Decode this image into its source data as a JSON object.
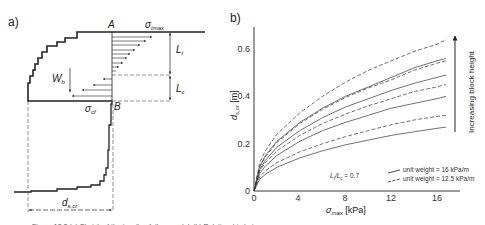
{
  "panel_a": {
    "label": "a)",
    "point_a": "A",
    "point_b": "B",
    "sigma_tmax": "σ",
    "sigma_tmax_sub": "tmax",
    "sigma_cf": "σ",
    "sigma_cf_sub": "cf",
    "weight": "W",
    "weight_sub": "b",
    "length_t": "L",
    "length_t_sub": "t",
    "length_c": "L",
    "length_c_sub": "c",
    "displacement": "d",
    "displacement_sub": "s,cr"
  },
  "panel_b": {
    "label": "b)",
    "arrow_label": "Increasing block height",
    "ratio_label": "L",
    "ratio_text": "t/L",
    "ratio_value": "c = 0.7",
    "legend": [
      {
        "style": "solid",
        "label": "unit weight = 16 kPa/m"
      },
      {
        "style": "dashed",
        "label": "unit weight = 12.5 kPa/m"
      }
    ]
  },
  "caption": "Figure 12.2 (a) Sketch of the toppling failure model; (b) Relationship between cr...",
  "chart_data": {
    "type": "line",
    "title": "",
    "xlabel": "σtmax [kPa]",
    "ylabel": "ds,cr [m]",
    "xlim": [
      0,
      18
    ],
    "ylim": [
      0,
      0.68
    ],
    "xticks": [
      0,
      4,
      8,
      12,
      16
    ],
    "yticks": [
      0,
      0.2,
      0.4,
      0.6
    ],
    "grid": false,
    "legend_position": "lower right",
    "annotations": [
      "Lt/Lc = 0.7",
      "Increasing block height (arrow upward)"
    ],
    "x": [
      0,
      0.5,
      1,
      2,
      4,
      6,
      8,
      10,
      12,
      14,
      16,
      16.8
    ],
    "series": [
      {
        "name": "unit weight = 12.5 kPa/m (h6)",
        "style": "dashed",
        "values": [
          0,
          0.12,
          0.17,
          0.24,
          0.33,
          0.4,
          0.46,
          0.51,
          0.55,
          0.59,
          0.62,
          0.64
        ]
      },
      {
        "name": "unit weight = 16 kPa/m (h5)",
        "style": "solid",
        "values": [
          0,
          0.105,
          0.15,
          0.21,
          0.29,
          0.35,
          0.4,
          0.44,
          0.48,
          0.52,
          0.55,
          0.56
        ]
      },
      {
        "name": "unit weight = 12.5 kPa/m (h5)",
        "style": "dashed",
        "values": [
          0,
          0.1,
          0.145,
          0.205,
          0.285,
          0.345,
          0.395,
          0.435,
          0.47,
          0.51,
          0.54,
          0.55
        ]
      },
      {
        "name": "unit weight = 16 kPa/m (h4)",
        "style": "solid",
        "values": [
          0,
          0.09,
          0.13,
          0.185,
          0.255,
          0.31,
          0.355,
          0.39,
          0.425,
          0.455,
          0.48,
          0.49
        ]
      },
      {
        "name": "unit weight = 12.5 kPa/m (h4)",
        "style": "dashed",
        "values": [
          0,
          0.085,
          0.12,
          0.17,
          0.235,
          0.285,
          0.325,
          0.36,
          0.39,
          0.42,
          0.44,
          0.45
        ]
      },
      {
        "name": "unit weight = 16 kPa/m (h3)",
        "style": "solid",
        "values": [
          0,
          0.075,
          0.105,
          0.15,
          0.21,
          0.255,
          0.29,
          0.32,
          0.35,
          0.37,
          0.39,
          0.4
        ]
      },
      {
        "name": "unit weight = 12.5 kPa/m (h3)",
        "style": "dashed",
        "values": [
          0,
          0.06,
          0.085,
          0.12,
          0.165,
          0.2,
          0.23,
          0.255,
          0.28,
          0.3,
          0.315,
          0.32
        ]
      },
      {
        "name": "unit weight = 16 kPa/m (h2)",
        "style": "solid",
        "values": [
          0,
          0.05,
          0.07,
          0.1,
          0.14,
          0.17,
          0.195,
          0.215,
          0.235,
          0.25,
          0.265,
          0.27
        ]
      }
    ]
  }
}
